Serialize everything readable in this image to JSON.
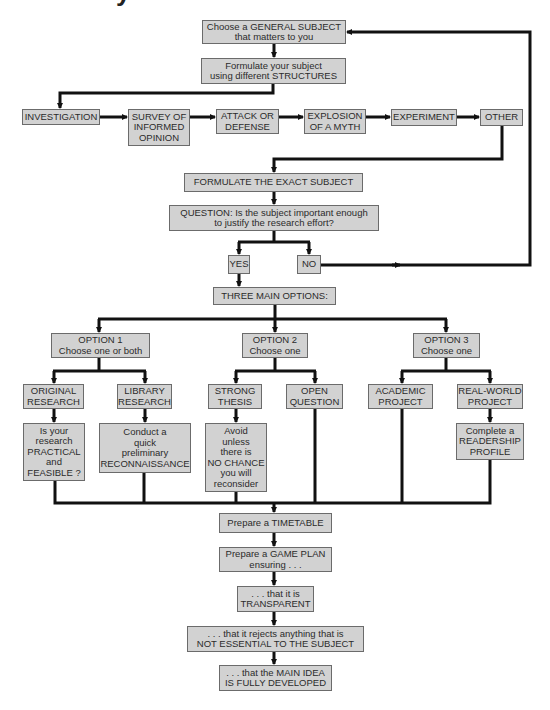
{
  "title_fragment": "y",
  "colors": {
    "box_fill": "#d2d2d2",
    "box_border": "#6b6b6b",
    "text": "#2b2b2b",
    "connector": "#111111",
    "background": "#ffffff"
  },
  "flowchart": {
    "nodes": {
      "general_subject": "Choose a GENERAL SUBJECT\nthat matters to you",
      "structures": "Formulate your subject\nusing different STRUCTURES",
      "investigation": "INVESTIGATION",
      "survey": "SURVEY OF\nINFORMED\nOPINION",
      "attack": "ATTACK OR\nDEFENSE",
      "explosion": "EXPLOSION\nOF A MYTH",
      "experiment": "EXPERIMENT",
      "other": "OTHER",
      "exact_subject": "FORMULATE THE EXACT SUBJECT",
      "question": "QUESTION: Is the subject important enough\nto justify the research effort?",
      "yes": "YES",
      "no": "NO",
      "three_options": "THREE MAIN OPTIONS:",
      "option_1": "OPTION 1\nChoose one or both",
      "option_2": "OPTION 2\nChoose one",
      "option_3": "OPTION 3\nChoose one",
      "original_research": "ORIGINAL\nRESEARCH",
      "library_research": "LIBRARY\nRESEARCH",
      "strong_thesis": "STRONG\nTHESIS",
      "open_question": "OPEN\nQUESTION",
      "academic_project": "ACADEMIC\nPROJECT",
      "real_world_project": "REAL-WORLD\nPROJECT",
      "practical": "Is your\nresearch\nPRACTICAL\nand\nFEASIBLE ?",
      "reconnaissance": "Conduct a\nquick\npreliminary\nRECONNAISSANCE",
      "avoid": "Avoid\nunless\nthere is\nNO CHANCE\nyou will\nreconsider",
      "readership": "Complete a\nREADERSHIP\nPROFILE",
      "timetable": "Prepare a TIMETABLE",
      "game_plan": "Prepare a GAME PLAN\nensuring . . .",
      "transparent": ". . . that it is\nTRANSPARENT",
      "not_essential": ". . . that it rejects anything that is\nNOT ESSENTIAL TO THE SUBJECT",
      "main_idea": ". . . that the MAIN IDEA\nIS FULLY DEVELOPED"
    },
    "edges": [
      [
        "general_subject",
        "structures"
      ],
      [
        "structures",
        "investigation"
      ],
      [
        "investigation",
        "survey"
      ],
      [
        "survey",
        "attack"
      ],
      [
        "attack",
        "explosion"
      ],
      [
        "explosion",
        "experiment"
      ],
      [
        "experiment",
        "other"
      ],
      [
        "other",
        "exact_subject"
      ],
      [
        "exact_subject",
        "question"
      ],
      [
        "question",
        "yes"
      ],
      [
        "question",
        "no"
      ],
      [
        "no",
        "general_subject"
      ],
      [
        "yes",
        "three_options"
      ],
      [
        "three_options",
        "option_1"
      ],
      [
        "three_options",
        "option_2"
      ],
      [
        "three_options",
        "option_3"
      ],
      [
        "option_1",
        "original_research"
      ],
      [
        "option_1",
        "library_research"
      ],
      [
        "option_2",
        "strong_thesis"
      ],
      [
        "option_2",
        "open_question"
      ],
      [
        "option_3",
        "academic_project"
      ],
      [
        "option_3",
        "real_world_project"
      ],
      [
        "original_research",
        "practical"
      ],
      [
        "library_research",
        "reconnaissance"
      ],
      [
        "strong_thesis",
        "avoid"
      ],
      [
        "real_world_project",
        "readership"
      ],
      [
        "practical",
        "timetable"
      ],
      [
        "reconnaissance",
        "timetable"
      ],
      [
        "avoid",
        "timetable"
      ],
      [
        "open_question",
        "timetable"
      ],
      [
        "academic_project",
        "timetable"
      ],
      [
        "readership",
        "timetable"
      ],
      [
        "timetable",
        "game_plan"
      ],
      [
        "game_plan",
        "transparent"
      ],
      [
        "transparent",
        "not_essential"
      ],
      [
        "not_essential",
        "main_idea"
      ]
    ]
  }
}
